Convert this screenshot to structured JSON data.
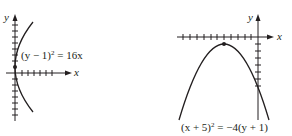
{
  "graphs": [
    {
      "id": "left",
      "equation": "(y − 1)² = 16x",
      "equation_base": "(y − 1)",
      "equation_exp": "2",
      "equation_rhs": " = 16x",
      "x_label": "x",
      "y_label": "y",
      "vertex": [
        0,
        1
      ],
      "opens": "right"
    },
    {
      "id": "right",
      "equation": "(x + 5)² = −4(y + 1)",
      "equation_base": "(x + 5)",
      "equation_exp": "2",
      "equation_rhs": " = −4(y + 1)",
      "x_label": "x",
      "y_label": "y",
      "vertex": [
        -5,
        -1
      ],
      "opens": "down"
    }
  ],
  "colors": {
    "ink": "#231f20",
    "background": "#ffffff"
  }
}
